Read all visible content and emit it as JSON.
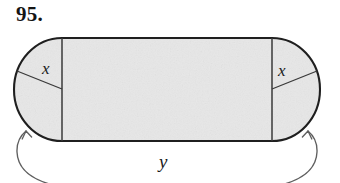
{
  "figure": {
    "exercise_number": "95.",
    "labels": {
      "left_radius": "x",
      "right_radius": "x",
      "width": "y"
    },
    "colors": {
      "fill": "#e7e7e7",
      "stroke": "#1f1f1f",
      "thin_stroke": "#4a4a4a",
      "arrow_stroke": "#5a5a5a",
      "text": "#141414",
      "background": "#ffffff"
    },
    "geometry": {
      "shape": "stadium",
      "left_cap_center_x": 62,
      "right_cap_center_x": 272,
      "top_y": 38,
      "bottom_y": 141,
      "cap_radius": 48,
      "left_extreme_x": 14,
      "right_extreme_x": 320,
      "center_y": 89
    }
  }
}
